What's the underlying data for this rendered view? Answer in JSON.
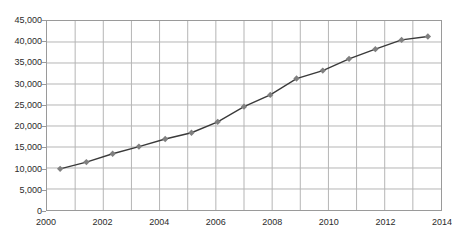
{
  "chart_data": {
    "type": "line",
    "title": "",
    "xlabel": "",
    "ylabel": "",
    "x": [
      2000,
      2001,
      2002,
      2003,
      2004,
      2005,
      2006,
      2007,
      2008,
      2009,
      2010,
      2011,
      2012,
      2013,
      2014
    ],
    "values": [
      9800,
      11400,
      13400,
      15100,
      16900,
      18400,
      21000,
      24600,
      27400,
      31300,
      33200,
      36000,
      38300,
      40500,
      41300
    ],
    "series": [
      {
        "name": "series-1",
        "values": [
          9800,
          11400,
          13400,
          15100,
          16900,
          18400,
          21000,
          24600,
          27400,
          31300,
          33200,
          36000,
          38300,
          40500,
          41300
        ]
      }
    ],
    "ylim": [
      0,
      45000
    ],
    "xlim": [
      2000,
      2014
    ],
    "ytick_values": [
      0,
      5000,
      10000,
      15000,
      20000,
      25000,
      30000,
      35000,
      40000,
      45000
    ],
    "ytick_labels": [
      "0",
      "5,000",
      "10,000",
      "15,000",
      "20,000",
      "25,000",
      "30,000",
      "35,000",
      "40,000",
      "45,000"
    ],
    "xtick_values": [
      2000,
      2002,
      2004,
      2006,
      2008,
      2010,
      2012,
      2014
    ],
    "xtick_labels": [
      "2000",
      "2002",
      "2004",
      "2006",
      "2008",
      "2010",
      "2012",
      "2014"
    ],
    "grid": true,
    "legend": false,
    "marker": "diamond",
    "line_color": "#3a3a3a",
    "marker_color": "#808080",
    "grid_color": "#b5b5b5",
    "axis_color": "#9a9a9a"
  }
}
